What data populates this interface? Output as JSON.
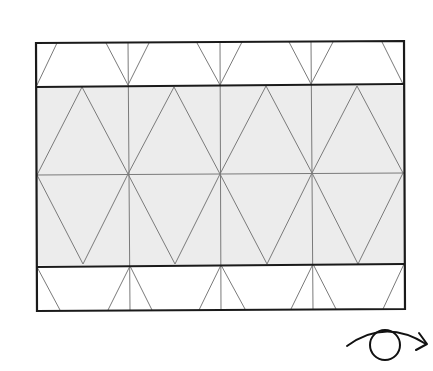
{
  "diagram": {
    "title": "",
    "colors": {
      "background": "#ffffff",
      "shaded_band": "#ececec",
      "thick_line": "#1a1a1a",
      "thin_line": "#7a7a7a"
    },
    "outer_rect": {
      "x1": 36,
      "y1": 42,
      "x2": 404,
      "y2": 310
    },
    "bands": [
      {
        "name": "top-band",
        "y_top": 42,
        "y_bottom": 86,
        "shaded": false
      },
      {
        "name": "middle-band",
        "y_top": 86,
        "y_bottom": 265,
        "shaded": true,
        "midline_y": 174
      },
      {
        "name": "bottom-band",
        "y_top": 265,
        "y_bottom": 310,
        "shaded": false
      }
    ],
    "vertical_lines_x": [
      128,
      220,
      312
    ],
    "middle_top_apexes_x": [
      82,
      174,
      266,
      357
    ],
    "middle_bottom_apexes_x": [
      83,
      175,
      267,
      358
    ],
    "icons": [
      {
        "name": "eye-with-rotation-arrow-icon",
        "position": "bottom-right"
      }
    ]
  }
}
